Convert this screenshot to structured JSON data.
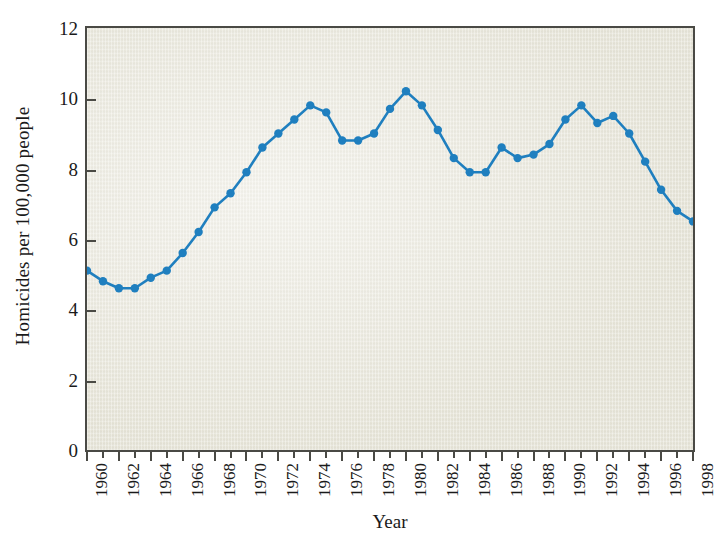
{
  "chart_data": {
    "type": "line",
    "title": "",
    "xlabel": "Year",
    "ylabel": "Homicides per 100,000 people",
    "xlim": [
      1960,
      1998
    ],
    "ylim": [
      0,
      12
    ],
    "yticks": [
      0,
      2,
      4,
      6,
      8,
      10,
      12
    ],
    "ytick_labels": [
      "0",
      "2",
      "4",
      "6",
      "8",
      "10",
      "12"
    ],
    "xticks": [
      1960,
      1961,
      1962,
      1963,
      1964,
      1965,
      1966,
      1967,
      1968,
      1969,
      1970,
      1971,
      1972,
      1973,
      1974,
      1975,
      1976,
      1977,
      1978,
      1979,
      1980,
      1981,
      1982,
      1983,
      1984,
      1985,
      1986,
      1987,
      1988,
      1989,
      1990,
      1991,
      1992,
      1993,
      1994,
      1995,
      1996,
      1997,
      1998
    ],
    "xtick_labels": [
      "1960",
      "",
      "1962",
      "",
      "1964",
      "",
      "1966",
      "",
      "1968",
      "",
      "1970",
      "",
      "1972",
      "",
      "1974",
      "",
      "1976",
      "",
      "1978",
      "",
      "1980",
      "",
      "1982",
      "",
      "1984",
      "",
      "1986",
      "",
      "1988",
      "",
      "1990",
      "",
      "1992",
      "",
      "1994",
      "",
      "1996",
      "",
      "1998"
    ],
    "grid": false,
    "legend": null,
    "series": [
      {
        "name": "Homicide rate",
        "color": "#1f7fbf",
        "marker": "circle",
        "x": [
          1960,
          1961,
          1962,
          1963,
          1964,
          1965,
          1966,
          1967,
          1968,
          1969,
          1970,
          1971,
          1972,
          1973,
          1974,
          1975,
          1976,
          1977,
          1978,
          1979,
          1980,
          1981,
          1982,
          1983,
          1984,
          1985,
          1986,
          1987,
          1988,
          1989,
          1990,
          1991,
          1992,
          1993,
          1994,
          1995,
          1996,
          1997,
          1998
        ],
        "values": [
          5.1,
          4.8,
          4.6,
          4.6,
          4.9,
          5.1,
          5.6,
          6.2,
          6.9,
          7.3,
          7.9,
          8.6,
          9.0,
          9.4,
          9.8,
          9.6,
          8.8,
          8.8,
          9.0,
          9.7,
          10.2,
          9.8,
          9.1,
          8.3,
          7.9,
          7.9,
          8.6,
          8.3,
          8.4,
          8.7,
          9.4,
          9.8,
          9.3,
          9.5,
          9.0,
          8.2,
          7.4,
          6.8,
          6.5
        ]
      }
    ]
  },
  "axes": {
    "ylabel_text": "Homicides per 100,000 people",
    "xlabel_text": "Year"
  }
}
